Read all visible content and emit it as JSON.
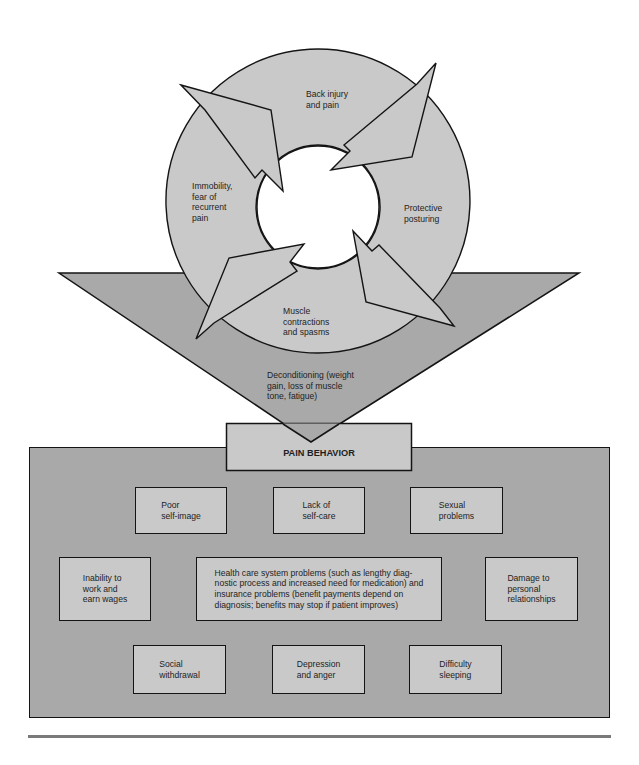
{
  "cycle": {
    "stages": [
      {
        "label": "Back injury\nand pain"
      },
      {
        "label": "Protective\nposturing"
      },
      {
        "label": "Muscle\ncontractions\nand spasms"
      },
      {
        "label": "Immobility,\nfear of\nrecurrent\npain"
      }
    ],
    "outcome": "Deconditioning (weight\ngain, loss of muscle\ntone, fatigue)"
  },
  "pain_behavior": {
    "title": "PAIN BEHAVIOR",
    "items": [
      {
        "label": "Poor\nself-image"
      },
      {
        "label": "Lack of\nself-care"
      },
      {
        "label": "Sexual\nproblems"
      },
      {
        "label": "Inability to\nwork and\nearn wages"
      },
      {
        "label": "Health care system problems (such as lengthy diag-\nnostic process and increased need for medication) and\ninsurance problems (benefit payments depend on\ndiagnosis; benefits may stop if patient improves)"
      },
      {
        "label": "Damage to\npersonal\nrelationships"
      },
      {
        "label": "Social\nwithdrawal"
      },
      {
        "label": "Depression\nand anger"
      },
      {
        "label": "Difficulty\nsleeping"
      }
    ]
  },
  "colors": {
    "cycle_fill": "#c9c9c9",
    "funnel_fill": "#a9a9a9",
    "panel_fill": "#a9a9a9",
    "box_fill": "#c9c9c9",
    "stroke": "#141414",
    "rule": "#7a7a7a"
  }
}
